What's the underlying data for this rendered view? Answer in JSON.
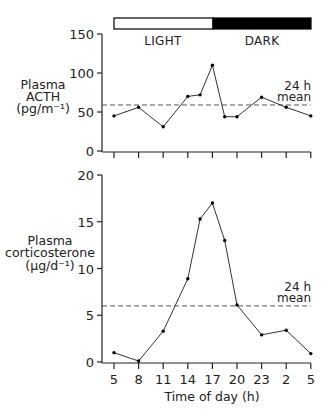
{
  "light_dark_bar": {
    "light_label": "LIGHT",
    "dark_label": "DARK",
    "light_color": "#ffffff",
    "dark_color": "#000000"
  },
  "chart_data": [
    {
      "type": "line",
      "title": "",
      "ylabel": [
        "Plasma",
        "ACTH",
        "(pg/m⁻¹)"
      ],
      "xlabel": "",
      "x": [
        "5",
        "8",
        "11",
        "14",
        "15.5",
        "17",
        "18.5",
        "20",
        "23",
        "2",
        "5"
      ],
      "x_positions": [
        0,
        1,
        2,
        3,
        3.5,
        4,
        4.5,
        5,
        6,
        7,
        8
      ],
      "values": [
        45,
        56,
        31,
        70,
        72,
        110,
        44,
        44,
        69,
        56,
        45
      ],
      "ylim": [
        0,
        150
      ],
      "yticks": [
        "0",
        "50",
        "100",
        "150"
      ],
      "mean_value": 59,
      "mean_label": [
        "24 h",
        "mean"
      ],
      "grid": false
    },
    {
      "type": "line",
      "title": "",
      "ylabel": [
        "Plasma",
        "corticosterone",
        "(µg/d⁻¹)"
      ],
      "xlabel": "Time of day (h)",
      "x": [
        "5",
        "8",
        "11",
        "14",
        "15.5",
        "17",
        "18.5",
        "20",
        "23",
        "2",
        "5"
      ],
      "x_positions": [
        0,
        1,
        2,
        3,
        3.5,
        4,
        4.5,
        5,
        6,
        7,
        8
      ],
      "values": [
        1.0,
        0.1,
        3.3,
        8.9,
        15.3,
        17.0,
        13.0,
        6.1,
        2.9,
        3.4,
        0.9
      ],
      "ylim": [
        0,
        20
      ],
      "yticks": [
        "0",
        "5",
        "10",
        "15",
        "20"
      ],
      "xticks": [
        "5",
        "8",
        "11",
        "14",
        "17",
        "20",
        "23",
        "2",
        "5"
      ],
      "mean_value": 6.0,
      "mean_label": [
        "24 h",
        "mean"
      ],
      "grid": false
    }
  ]
}
